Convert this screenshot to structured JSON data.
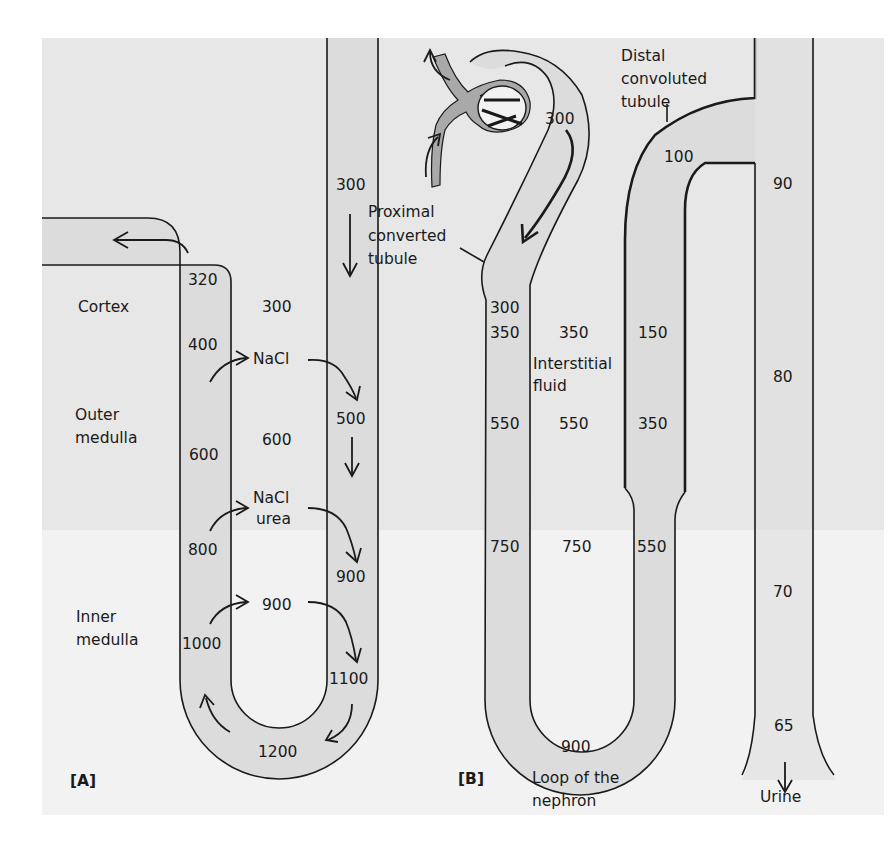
{
  "colors": {
    "band_upper": "#e7e7e7",
    "band_lower": "#f2f2f2",
    "tubule_fill": "#dcdcdc",
    "glomerulus": "#a9a9a9",
    "ink": "#1a1a1a"
  },
  "panel_a": {
    "tag": "[A]",
    "regions": {
      "cortex": "Cortex",
      "outer_medulla_1": "Outer",
      "outer_medulla_2": "medulla",
      "inner_medulla_1": "Inner",
      "inner_medulla_2": "medulla"
    },
    "ascending_limb": [
      "320",
      "400",
      "600",
      "800",
      "1000"
    ],
    "interstitium": [
      "300",
      "600",
      "900"
    ],
    "solutes": {
      "first": "NaCl",
      "second_1": "NaCl",
      "second_2": "urea"
    },
    "descending_limb": [
      "300",
      "500",
      "900",
      "1100"
    ],
    "bend": "1200"
  },
  "panel_b": {
    "tag": "[B]",
    "labels": {
      "proximal_1": "Proximal",
      "proximal_2": "converted",
      "proximal_3": "tubule",
      "distal_1": "Distal",
      "distal_2": "convoluted",
      "distal_3": "tubule",
      "interstitial_1": "Interstitial",
      "interstitial_2": "fluid",
      "loop_1": "Loop of the",
      "loop_2": "nephron",
      "urine": "Urine"
    },
    "glomerular": "300",
    "descending_limb": [
      "300",
      "350",
      "550",
      "750"
    ],
    "interstitium": [
      "350",
      "550",
      "750"
    ],
    "ascending_limb": [
      "150",
      "350",
      "550"
    ],
    "bend": "900",
    "distal": "100",
    "collecting_duct": [
      "90",
      "80",
      "70",
      "65"
    ]
  }
}
